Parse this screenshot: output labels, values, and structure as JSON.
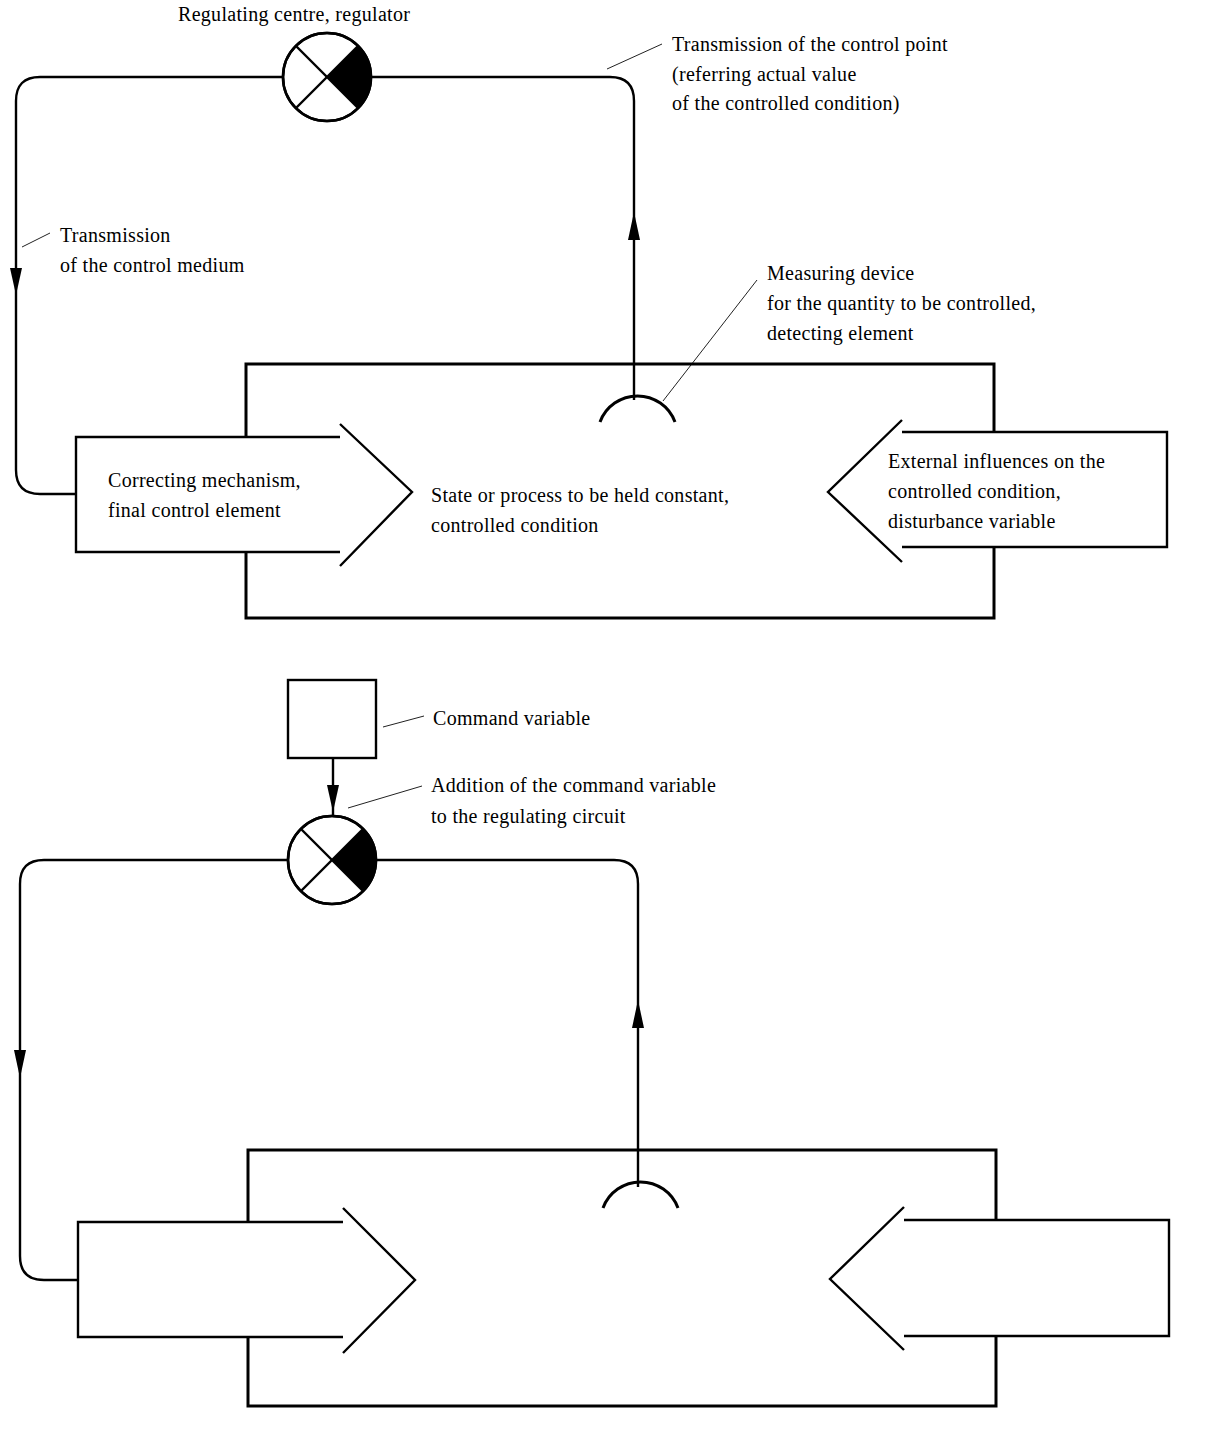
{
  "diagram": {
    "type": "control-loop",
    "panels": [
      {
        "id": "basic-control-loop",
        "labels": {
          "regulator": "Regulating centre, regulator",
          "transmission_control_point": [
            "Transmission of the control point",
            "(referring actual value",
            "of the controlled condition)"
          ],
          "transmission_control_medium": [
            "Transmission",
            "of the control medium"
          ],
          "measuring_device": [
            "Measuring device",
            "for the quantity to be controlled,",
            "detecting element"
          ],
          "correcting_mechanism": [
            "Correcting mechanism,",
            "final control element"
          ],
          "controlled_condition": [
            "State or process to be held constant,",
            "controlled condition"
          ],
          "external_influences": [
            "External influences on the",
            "controlled condition,",
            "disturbance variable"
          ]
        }
      },
      {
        "id": "control-loop-with-command-variable",
        "labels": {
          "command_variable": "Command variable",
          "addition_command_variable": [
            "Addition of the command variable",
            "to the regulating circuit"
          ]
        }
      }
    ],
    "colors": {
      "line": "#000000",
      "background": "#ffffff"
    }
  }
}
